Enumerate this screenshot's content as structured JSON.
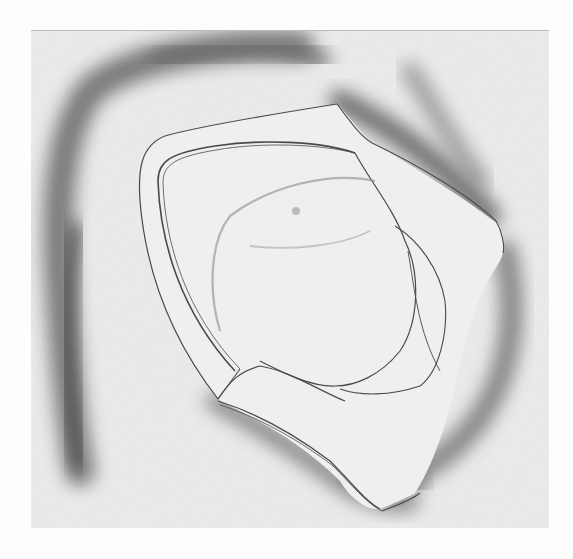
{
  "figure": {
    "caption": "",
    "colors": {
      "page_background": "#fdfdfd",
      "plate_background": "#ededed",
      "shading_dark": "#5a5a5a",
      "shading_mid": "#8a8a8a",
      "line_ink": "#4a4a4a",
      "form_fill": "#efefef"
    },
    "bounds": {
      "plate_left": 31,
      "plate_top": 30,
      "plate_width": 518,
      "plate_height": 497
    }
  }
}
